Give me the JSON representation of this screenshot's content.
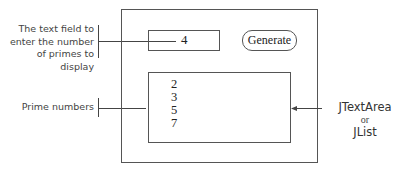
{
  "diagram": {
    "window": {
      "text_field": {
        "value": "4"
      },
      "generate_button": {
        "label": "Generate"
      },
      "output_area": {
        "lines": [
          "2",
          "3",
          "5",
          "7"
        ]
      }
    },
    "annotations": {
      "text_field_label": [
        "The text field to",
        "enter the number",
        "of primes to display"
      ],
      "output_label": "Prime numbers",
      "component_label": {
        "line1": "JTextArea",
        "line2": "or",
        "line3": "JList"
      }
    },
    "colors": {
      "line": "#444444",
      "text": "#222222",
      "background": "#ffffff"
    }
  }
}
